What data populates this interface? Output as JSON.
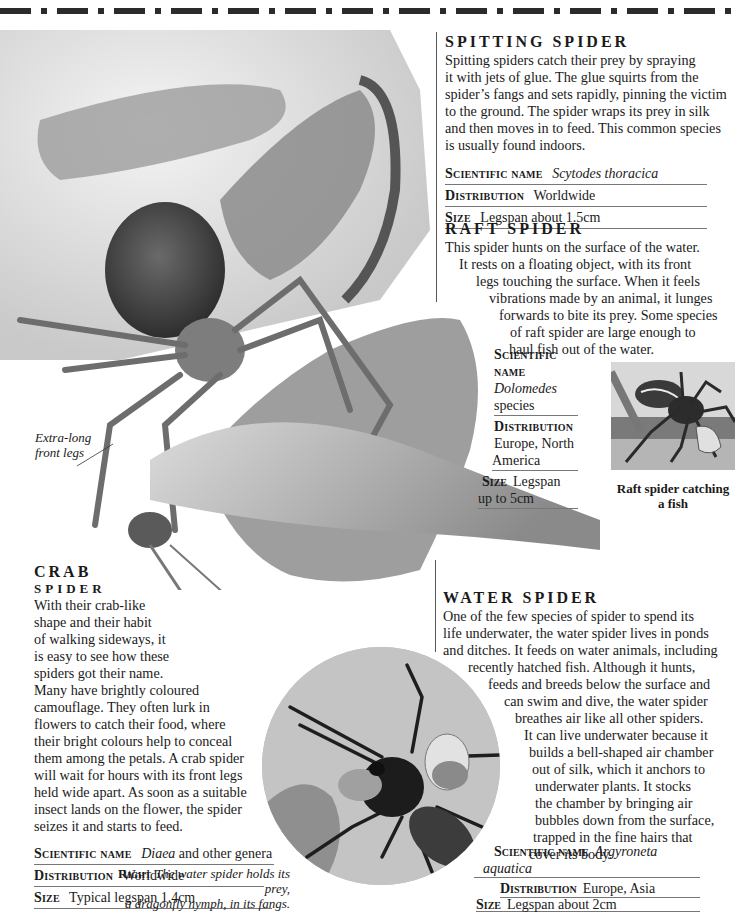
{
  "page": {
    "header_rule": "dashed-black-rule"
  },
  "spitting_spider": {
    "heading": "Spitting spider",
    "body": [
      "Spitting spiders catch their prey by spraying",
      "it with jets of glue. The glue squirts from the",
      "spider’s fangs and sets rapidly, pinning the victim",
      "to the ground. The spider wraps its prey in silk",
      "and then moves in to feed. This common species",
      "is usually found indoors."
    ],
    "facts": [
      {
        "label": "Scientific name",
        "value": "Scytodes thoracica",
        "italic": true
      },
      {
        "label": "Distribution",
        "value": "Worldwide",
        "italic": false
      },
      {
        "label": "Size",
        "value": "Legspan about 1.5cm",
        "italic": false
      }
    ]
  },
  "raft_spider": {
    "heading": "Raft spider",
    "body": [
      "This spider hunts on the surface of the water.",
      "It rests on a floating object, with its front",
      "legs touching the surface. When it feels",
      "vibrations made by an animal, it lunges",
      "forwards to bite its prey. Some species",
      "of raft spider are large enough to",
      "haul fish out of the water."
    ],
    "facts": {
      "scientific_label": "Scientific name",
      "scientific_value_1": "Dolomedes",
      "scientific_value_2": "species",
      "distribution_label": "Distribution",
      "distribution_value_1": "Europe, North",
      "distribution_value_2": "America",
      "size_label": "Size",
      "size_value_1": "Legspan",
      "size_value_2": "up to 5cm"
    },
    "photo_caption_1": "Raft spider catching",
    "photo_caption_2": "a fish"
  },
  "crab_spider": {
    "heading_1": "Crab",
    "heading_2": "spider",
    "annotation_1": "Extra-long",
    "annotation_2": "front legs",
    "body": [
      "With their crab-like",
      "shape and their habit",
      "of walking sideways, it",
      "is easy to see how these",
      "spiders got their name.",
      "Many have brightly coloured",
      "camouflage. They often lurk in",
      "flowers to catch their food, where",
      "their bright colours help to conceal",
      "them among the petals. A crab spider",
      "will wait for hours with its front legs",
      "held wide apart. As soon as a suitable",
      "insect lands on the flower, the spider",
      "seizes it and starts to feed."
    ],
    "facts": [
      {
        "label": "Scientific name",
        "value_italic": "Diaea",
        "value_rest": " and other genera"
      },
      {
        "label": "Distribution",
        "value_italic": "",
        "value_rest": "Worldwide"
      },
      {
        "label": "Size",
        "value_italic": "",
        "value_rest": "Typical legspan 1.4cm"
      }
    ]
  },
  "water_spider": {
    "heading": "Water spider",
    "body": [
      "One of the few species of spider to spend its",
      "life underwater, the water spider lives in ponds",
      "and ditches. It feeds on water animals, including",
      "recently hatched fish. Although it hunts,",
      "feeds and breeds below the surface and",
      "can swim and dive, the water spider",
      "breathes air like all other spiders.",
      "It can live underwater because it",
      "builds a bell-shaped air chamber",
      "out of silk, which it anchors to",
      "underwater plants. It stocks",
      "the chamber by bringing air",
      "bubbles down from the surface,",
      "trapped in the fine hairs that",
      "cover its body."
    ],
    "facts": {
      "scientific_label": "Scientific name",
      "scientific_value_1": "Argyroneta",
      "scientific_value_2": "aquatica",
      "distribution_label": "Distribution",
      "distribution_value": "Europe, Asia",
      "size_label": "Size",
      "size_value": "Legspan about 2cm"
    },
    "photo_caption_label": "Right",
    "photo_caption_1": "The water spider holds its prey,",
    "photo_caption_2": "a dragonfly nymph, in its fangs."
  }
}
